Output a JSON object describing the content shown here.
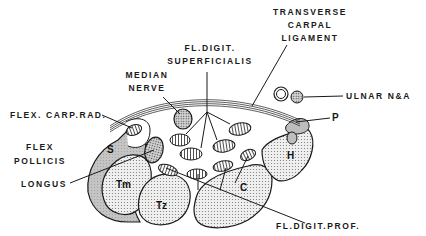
{
  "diagram": {
    "labels": {
      "transverse_carpal_ligament": [
        "TRANSVERSE",
        "CARPAL",
        "LIGAMENT"
      ],
      "fl_digit_superficialis": [
        "FL.DIGIT.",
        "SUPERFICIALIS"
      ],
      "median_nerve": [
        "MEDIAN",
        "NERVE"
      ],
      "ulnar_na": "ULNAR N&A",
      "flex_carp_rad": "FLEX. CARP.RAD.",
      "p": "P",
      "flex_pollicis_longus": [
        "FLEX",
        "POLLICIS",
        "LONGUS"
      ],
      "fl_digit_prof": "FL.DIGIT.PROF."
    },
    "bone_labels": {
      "scaphoid": "S",
      "trapezium": "Tm",
      "trapezoid": "Tz",
      "capitate": "C",
      "hamate": "H"
    },
    "colors": {
      "ink": "#1a1a1a",
      "bone_fill": "#e4e4e4",
      "dark_region": "#bdbdbd",
      "background": "#ffffff"
    }
  }
}
